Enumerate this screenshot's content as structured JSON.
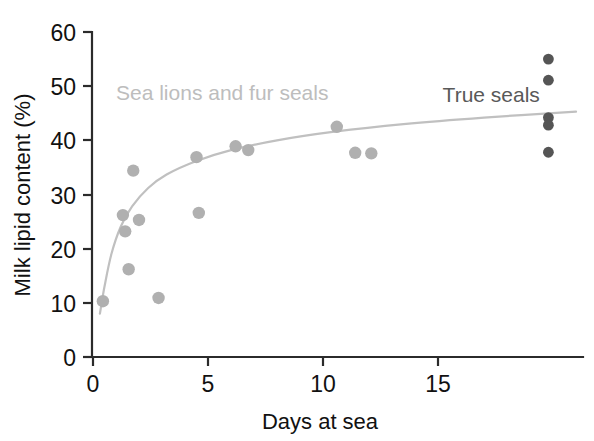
{
  "chart_data": {
    "type": "scatter",
    "title": "",
    "subtitle": "",
    "xlabel": "Days at sea",
    "ylabel": "Milk lipid content (%)",
    "xlim": [
      0,
      21.5
    ],
    "ylim": [
      0,
      60
    ],
    "xticks": [
      0,
      5,
      10,
      15
    ],
    "xtick_labels": [
      "0",
      "5",
      "10",
      "15"
    ],
    "yticks": [
      0,
      10,
      20,
      30,
      40,
      50,
      60
    ],
    "ytick_labels": [
      "0",
      "10",
      "20",
      "30",
      "40",
      "50",
      "60"
    ],
    "grid": false,
    "legend_position": "in-plot annotations",
    "annotations": [
      {
        "text": "Sea lions and fur seals",
        "x": 1.0,
        "y": 47.5,
        "color": "#bdbdbd"
      },
      {
        "text": "True seals",
        "x": 15.2,
        "y": 47.0,
        "color": "#595959"
      }
    ],
    "series": [
      {
        "name": "Sea lions and fur seals",
        "color": "#b0b0b0",
        "marker": "circle",
        "points": [
          {
            "x": 0.43,
            "y": 10.3
          },
          {
            "x": 1.3,
            "y": 26.2
          },
          {
            "x": 1.4,
            "y": 23.2
          },
          {
            "x": 1.55,
            "y": 16.2
          },
          {
            "x": 1.75,
            "y": 34.4
          },
          {
            "x": 2.0,
            "y": 25.3
          },
          {
            "x": 2.85,
            "y": 10.9
          },
          {
            "x": 4.5,
            "y": 36.9
          },
          {
            "x": 4.6,
            "y": 26.6
          },
          {
            "x": 6.2,
            "y": 38.9
          },
          {
            "x": 6.75,
            "y": 38.2
          },
          {
            "x": 10.6,
            "y": 42.5
          },
          {
            "x": 11.4,
            "y": 37.7
          },
          {
            "x": 12.1,
            "y": 37.6
          }
        ]
      },
      {
        "name": "True seals",
        "color": "#555555",
        "marker": "circle",
        "points": [
          {
            "x": 19.8,
            "y": 55.0
          },
          {
            "x": 19.8,
            "y": 51.1
          },
          {
            "x": 19.8,
            "y": 44.2
          },
          {
            "x": 19.8,
            "y": 42.8
          },
          {
            "x": 19.8,
            "y": 37.8
          }
        ]
      }
    ],
    "fit_curve": {
      "name": "logarithmic trend line",
      "color": "#c0c0c0",
      "description": "rising saturating curve through sea lion and fur seal data",
      "points": [
        {
          "x": 0.3,
          "y": 8.0
        },
        {
          "x": 0.5,
          "y": 13.0
        },
        {
          "x": 0.8,
          "y": 19.0
        },
        {
          "x": 1.2,
          "y": 24.0
        },
        {
          "x": 1.7,
          "y": 27.8
        },
        {
          "x": 2.4,
          "y": 31.2
        },
        {
          "x": 3.2,
          "y": 33.7
        },
        {
          "x": 4.5,
          "y": 36.2
        },
        {
          "x": 6.0,
          "y": 38.2
        },
        {
          "x": 8.0,
          "y": 40.0
        },
        {
          "x": 10.5,
          "y": 41.6
        },
        {
          "x": 13.5,
          "y": 43.0
        },
        {
          "x": 17.0,
          "y": 44.2
        },
        {
          "x": 21.0,
          "y": 45.3
        }
      ]
    }
  },
  "axes": {
    "y_title": "Milk lipid content (%)",
    "x_title": "Days at sea",
    "x_ticks": [
      "0",
      "5",
      "10",
      "15"
    ],
    "y_ticks": [
      "60",
      "50",
      "40",
      "30",
      "20",
      "10",
      "0"
    ]
  },
  "labels": {
    "light_series": "Sea lions and fur seals",
    "dark_series": "True seals"
  },
  "colors": {
    "light_marker": "#b0b0b0",
    "dark_marker": "#555555",
    "curve": "#c0c0c0",
    "axis": "#2b2b2b",
    "text": "#111111",
    "background": "#ffffff"
  }
}
